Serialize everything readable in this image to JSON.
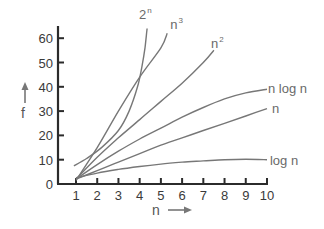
{
  "chart_data": {
    "type": "line",
    "title": "",
    "xlabel": "n",
    "ylabel": "f",
    "xlim": [
      1,
      10
    ],
    "ylim": [
      0,
      60
    ],
    "grid": false,
    "legend_position": "inline labels at curve ends",
    "x_ticks": [
      1,
      2,
      3,
      4,
      5,
      6,
      7,
      8,
      9,
      10
    ],
    "y_ticks": [
      0,
      10,
      20,
      30,
      40,
      50,
      60
    ],
    "series": [
      {
        "name": "2^n",
        "label_base": "2",
        "label_sup": "n",
        "points": [
          [
            0.9,
            7.5
          ],
          [
            1.5,
            10.5
          ],
          [
            2.2,
            15
          ],
          [
            3.0,
            22
          ],
          [
            3.5,
            30
          ],
          [
            3.9,
            40
          ],
          [
            4.1,
            48
          ],
          [
            4.25,
            56
          ],
          [
            4.35,
            64
          ]
        ]
      },
      {
        "name": "n^3",
        "label_base": "n",
        "label_sup": "3",
        "points": [
          [
            1,
            1.5
          ],
          [
            2,
            15
          ],
          [
            3,
            30
          ],
          [
            4,
            44
          ],
          [
            5,
            56
          ],
          [
            5.3,
            62
          ]
        ]
      },
      {
        "name": "n^2",
        "label_base": "n",
        "label_sup": "2",
        "points": [
          [
            1,
            2
          ],
          [
            2,
            11
          ],
          [
            3,
            19
          ],
          [
            4,
            26.5
          ],
          [
            5,
            34
          ],
          [
            6,
            41.5
          ],
          [
            7,
            50
          ],
          [
            7.5,
            55
          ]
        ]
      },
      {
        "name": "n log n",
        "label_base": "n log n",
        "label_sup": "",
        "points": [
          [
            1,
            2
          ],
          [
            2,
            8
          ],
          [
            3,
            13.5
          ],
          [
            4,
            18.5
          ],
          [
            5,
            23
          ],
          [
            6,
            27.5
          ],
          [
            7,
            31.5
          ],
          [
            8,
            35
          ],
          [
            9,
            37.5
          ],
          [
            10,
            39
          ]
        ]
      },
      {
        "name": "n",
        "label_base": "n",
        "label_sup": "",
        "points": [
          [
            1,
            2
          ],
          [
            2,
            5.5
          ],
          [
            3,
            9
          ],
          [
            4,
            12.5
          ],
          [
            5,
            16
          ],
          [
            6,
            19
          ],
          [
            7,
            22
          ],
          [
            8,
            25
          ],
          [
            9,
            28
          ],
          [
            10,
            31
          ]
        ]
      },
      {
        "name": "log n",
        "label_base": "log n",
        "label_sup": "",
        "points": [
          [
            1,
            2.5
          ],
          [
            2,
            4.5
          ],
          [
            3,
            6
          ],
          [
            4,
            7.2
          ],
          [
            5,
            8.2
          ],
          [
            6,
            9
          ],
          [
            7,
            9.5
          ],
          [
            8,
            10
          ],
          [
            9,
            10.2
          ],
          [
            10,
            10
          ]
        ]
      }
    ]
  },
  "labels": {
    "y_axis": "f",
    "x_axis": "n"
  }
}
